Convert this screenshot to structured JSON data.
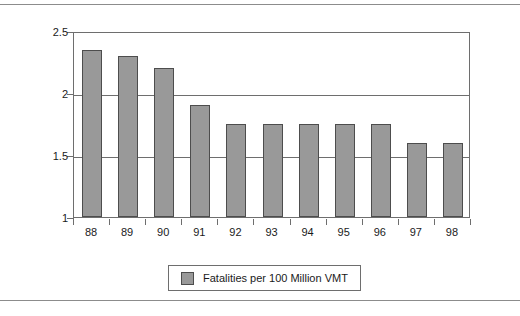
{
  "chart_data": {
    "type": "bar",
    "title": "",
    "subtitle": "",
    "xlabel": "",
    "ylabel": "",
    "categories": [
      "88",
      "89",
      "90",
      "91",
      "92",
      "93",
      "94",
      "95",
      "96",
      "97",
      "98"
    ],
    "values": [
      2.35,
      2.3,
      2.2,
      1.9,
      1.75,
      1.75,
      1.75,
      1.75,
      1.75,
      1.6,
      1.6
    ],
    "series": [
      {
        "name": "Fatalities per 100 Million VMT",
        "values": [
          2.35,
          2.3,
          2.2,
          1.9,
          1.75,
          1.75,
          1.75,
          1.75,
          1.75,
          1.6,
          1.6
        ]
      }
    ],
    "ylim": [
      1,
      2.5
    ],
    "ytick_labels": [
      "2.5",
      "2",
      "1.5",
      "1"
    ],
    "ytick_values": [
      2.5,
      2,
      1.5,
      1
    ],
    "grid": true,
    "legend": {
      "position": "bottom",
      "entries": [
        {
          "label": "Fatalities per 100 Million VMT",
          "color": "#999999"
        }
      ]
    },
    "colors": {
      "bar_fill": "#999999",
      "bar_border": "#4d4d4d",
      "axis": "#6e6e6e",
      "text": "#1a1a1a",
      "rule": "#8c8c8c",
      "background": "#ffffff"
    }
  }
}
